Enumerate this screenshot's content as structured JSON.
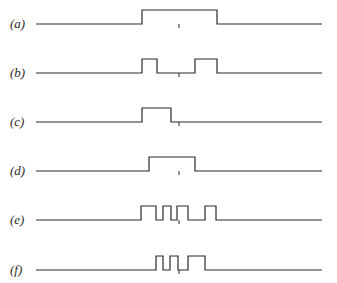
{
  "figure": {
    "line_color": "#2b2b2b",
    "baseline": {
      "x_start": 36,
      "x_end": 322
    },
    "center_tick_x": 179,
    "pulse_height": 14,
    "rows": [
      {
        "label": "(a)",
        "baseline_y": 24,
        "pulses": [
          [
            142,
            217
          ]
        ]
      },
      {
        "label": "(b)",
        "baseline_y": 73,
        "pulses": [
          [
            142,
            157
          ],
          [
            195,
            217
          ]
        ]
      },
      {
        "label": "(c)",
        "baseline_y": 122,
        "pulses": [
          [
            142,
            171
          ]
        ]
      },
      {
        "label": "(d)",
        "baseline_y": 171,
        "pulses": [
          [
            149,
            195
          ]
        ]
      },
      {
        "label": "(e)",
        "baseline_y": 220,
        "pulses": [
          [
            141,
            156
          ],
          [
            163,
            171
          ],
          [
            177,
            188
          ],
          [
            205,
            216
          ]
        ]
      },
      {
        "label": "(f)",
        "baseline_y": 270,
        "pulses": [
          [
            156,
            163
          ],
          [
            170,
            178
          ],
          [
            188,
            205
          ]
        ]
      }
    ]
  }
}
